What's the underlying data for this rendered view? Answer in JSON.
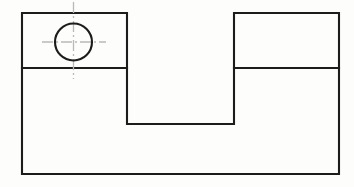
{
  "document": {
    "title": "Orthographic View — Slotted Plate with Hole",
    "view_type": "front-view",
    "drawing_standard": "engineering-line-drawing",
    "background_color": "#fdfdfc"
  },
  "styles": {
    "object_line_color": "#1c1c1c",
    "object_line_width": 2.1,
    "center_line_color": "#b9b9b9",
    "center_line_width": 1.3,
    "center_line_dash": "11 3 2 3"
  },
  "geometry": {
    "outer_rectangle": {
      "name": "plate-outline",
      "x": 22,
      "y": 13,
      "width": 317,
      "height": 161,
      "right": 339,
      "bottom": 174
    },
    "horizontal_divider": {
      "name": "step-line",
      "y": 68,
      "left_segment": {
        "x1": 22,
        "x2": 127
      },
      "right_segment": {
        "x1": 234,
        "x2": 339
      }
    },
    "notch": {
      "name": "center-slot",
      "x": 127,
      "y": 13,
      "width": 107,
      "height": 111,
      "right": 234,
      "bottom": 124
    },
    "hole": {
      "name": "through-hole",
      "center_x": 73.5,
      "center_y": 42,
      "radius": 18.5,
      "diameter": 37
    },
    "hole_centerlines": {
      "horizontal": {
        "x1": 42,
        "x2": 106,
        "y": 42
      },
      "vertical": {
        "x": 73.5,
        "y1": 2,
        "y2": 79
      }
    }
  },
  "labels": {
    "none_visible": ""
  }
}
